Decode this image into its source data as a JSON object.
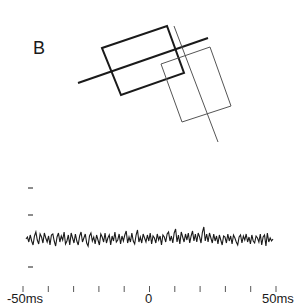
{
  "panel": {
    "label": "B"
  },
  "diagram": {
    "thick_rect": [
      [
        102,
        48
      ],
      [
        167,
        26
      ],
      [
        184,
        73
      ],
      [
        121,
        95
      ]
    ],
    "thick_line": [
      [
        78,
        83
      ],
      [
        208,
        38
      ]
    ],
    "thin_rect": [
      [
        161,
        64
      ],
      [
        210,
        47
      ],
      [
        231,
        106
      ],
      [
        182,
        122
      ]
    ],
    "thin_line": [
      [
        174,
        26
      ],
      [
        218,
        142
      ]
    ],
    "thick_color": "#1a1a1a",
    "thin_color": "#555555"
  },
  "chart_data": {
    "type": "line",
    "title": "",
    "xlabel": "",
    "ylabel": "",
    "x_range_ms": [
      -50,
      50
    ],
    "x_tick_labels": [
      "-50ms",
      "0",
      "50ms"
    ],
    "x_ticks_ms": [
      -50,
      -40,
      -30,
      -20,
      -10,
      0,
      10,
      20,
      30,
      40,
      50
    ],
    "y_ticks_px": [
      188,
      215,
      267
    ],
    "grid": false,
    "series": [
      {
        "name": "cross-correlogram",
        "baseline_px": 239,
        "values": [
          0,
          2,
          -3,
          4,
          -2,
          -6,
          3,
          7,
          -1,
          -5,
          5,
          2,
          -4,
          6,
          1,
          -3,
          3,
          -6,
          4,
          5,
          -2,
          -7,
          2,
          6,
          -3,
          3,
          -1,
          7,
          -5,
          -2,
          4,
          -6,
          6,
          1,
          -4,
          5,
          -2,
          -6,
          3,
          7,
          -3,
          1,
          5,
          -4,
          -7,
          3,
          6,
          -2,
          2,
          -5,
          4,
          -1,
          -6,
          5,
          2,
          -3,
          6,
          -4,
          1,
          4,
          -6,
          3,
          -2,
          7,
          -3,
          -1,
          5,
          -5,
          3,
          -2,
          4,
          8,
          -4,
          2,
          -3,
          6,
          -2,
          -5,
          4,
          9,
          -3,
          2,
          -4,
          5,
          1,
          -3,
          4,
          -2,
          6,
          -5,
          3,
          1,
          -4,
          5,
          -1,
          3,
          -6,
          4,
          2,
          -3,
          5,
          7,
          -2,
          3,
          -4,
          6,
          10,
          -3,
          4,
          -5,
          7,
          2,
          -3,
          5,
          -1,
          6,
          -4,
          3,
          8,
          -2,
          5,
          -3,
          6,
          2,
          -4,
          7,
          12,
          -2,
          5,
          -3,
          6,
          1,
          -4,
          5,
          -2,
          3,
          -5,
          4,
          -1,
          -6,
          3,
          2,
          -4,
          5,
          -2,
          3,
          -5,
          4,
          1,
          -3,
          -6,
          2,
          4,
          -4,
          3,
          -1,
          5,
          -3,
          2,
          -5,
          4,
          -2,
          -4,
          3,
          1,
          -3,
          5,
          -6,
          2,
          4,
          -7,
          6,
          -3,
          1,
          -2,
          0
        ],
        "x_start_px": 26,
        "x_end_px": 273,
        "scale_px": 1.0
      }
    ]
  }
}
